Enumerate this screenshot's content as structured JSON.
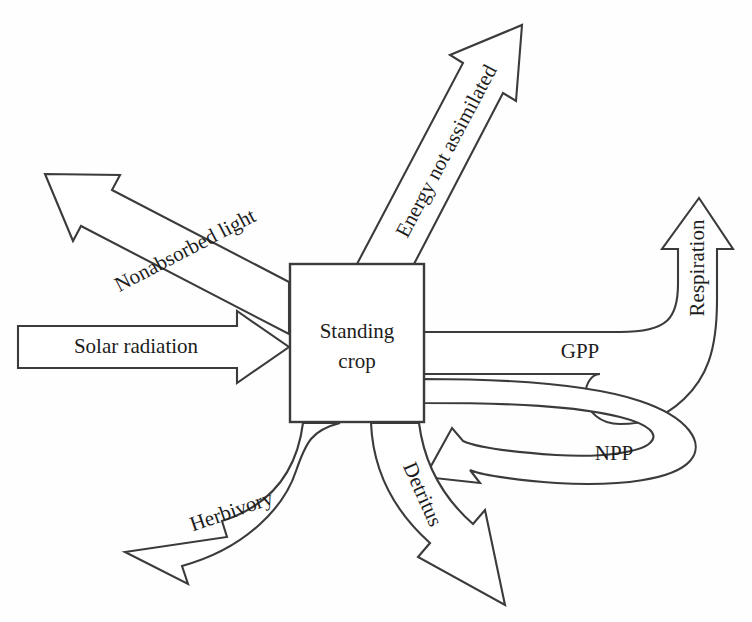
{
  "diagram": {
    "background_color": "#fefefe",
    "line_color": "#3b3b3b",
    "text_color": "#1d1d1d",
    "center_node": {
      "label_line1": "Standing",
      "label_line2": "crop"
    },
    "flows": [
      {
        "id": "solar-radiation",
        "label": "Solar radiation",
        "direction": "into-node",
        "shape": "straight-block-arrow",
        "orientation": "horizontal-right"
      },
      {
        "id": "nonabsorbed-light",
        "label": "Nonabsorbed light",
        "direction": "out-of-node",
        "shape": "straight-block-arrow",
        "orientation": "diagonal-up-left"
      },
      {
        "id": "energy-not-assimilated",
        "label": "Energy not assimilated",
        "direction": "out-of-node",
        "shape": "straight-block-arrow",
        "orientation": "diagonal-up-right"
      },
      {
        "id": "gpp",
        "label": "GPP",
        "direction": "out-of-node",
        "shape": "curved-band",
        "orientation": "right"
      },
      {
        "id": "respiration",
        "label": "Respiration",
        "direction": "out-of-node",
        "shape": "curved-block-arrow",
        "orientation": "up"
      },
      {
        "id": "npp",
        "label": "NPP",
        "direction": "into-node",
        "shape": "curved-block-arrow",
        "orientation": "loop-back-left"
      },
      {
        "id": "herbivory",
        "label": "Herbivory",
        "direction": "out-of-node",
        "shape": "curved-block-arrow",
        "orientation": "down-left"
      },
      {
        "id": "detritus",
        "label": "Detritus",
        "direction": "out-of-node",
        "shape": "curved-block-arrow",
        "orientation": "down-right"
      }
    ]
  }
}
